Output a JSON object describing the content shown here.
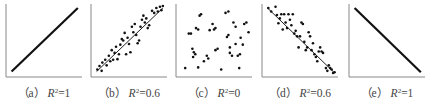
{
  "chart_data": [
    {
      "type": "scatter",
      "panel": "a",
      "label": "（a）",
      "r2_text": "R",
      "r2_sup": "2",
      "r2_value": "=1",
      "r2": 1,
      "trend": "positive",
      "xlim": [
        0,
        1
      ],
      "ylim": [
        0,
        1
      ],
      "line": [
        [
          0.05,
          0.05
        ],
        [
          0.97,
          0.97
        ]
      ],
      "points": []
    },
    {
      "type": "scatter",
      "panel": "b",
      "label": "（b）",
      "r2_text": "R",
      "r2_sup": "2",
      "r2_value": "=0.6",
      "r2": 0.6,
      "trend": "positive",
      "xlim": [
        0,
        1
      ],
      "ylim": [
        0,
        1
      ],
      "line": [
        [
          0.05,
          0.05
        ],
        [
          0.97,
          0.97
        ]
      ],
      "points": [
        [
          0.06,
          0.08
        ],
        [
          0.09,
          0.13
        ],
        [
          0.12,
          0.06
        ],
        [
          0.13,
          0.18
        ],
        [
          0.17,
          0.22
        ],
        [
          0.19,
          0.14
        ],
        [
          0.22,
          0.28
        ],
        [
          0.24,
          0.2
        ],
        [
          0.26,
          0.36
        ],
        [
          0.28,
          0.22
        ],
        [
          0.3,
          0.32
        ],
        [
          0.32,
          0.41
        ],
        [
          0.34,
          0.23
        ],
        [
          0.36,
          0.3
        ],
        [
          0.38,
          0.44
        ],
        [
          0.4,
          0.52
        ],
        [
          0.42,
          0.5
        ],
        [
          0.44,
          0.61
        ],
        [
          0.46,
          0.3
        ],
        [
          0.48,
          0.54
        ],
        [
          0.5,
          0.45
        ],
        [
          0.52,
          0.33
        ],
        [
          0.54,
          0.7
        ],
        [
          0.56,
          0.62
        ],
        [
          0.58,
          0.74
        ],
        [
          0.6,
          0.58
        ],
        [
          0.62,
          0.46
        ],
        [
          0.64,
          0.5
        ],
        [
          0.66,
          0.7
        ],
        [
          0.68,
          0.8
        ],
        [
          0.7,
          0.86
        ],
        [
          0.72,
          0.76
        ],
        [
          0.74,
          0.82
        ],
        [
          0.76,
          0.68
        ],
        [
          0.78,
          0.72
        ],
        [
          0.82,
          0.93
        ],
        [
          0.85,
          0.9
        ],
        [
          0.88,
          0.97
        ],
        [
          0.9,
          0.92
        ],
        [
          0.93,
          0.99
        ],
        [
          0.95,
          0.94
        ],
        [
          0.97,
          1.0
        ]
      ]
    },
    {
      "type": "scatter",
      "panel": "c",
      "label": "（c）",
      "r2_text": "R",
      "r2_sup": "2",
      "r2_value": "=0",
      "r2": 0,
      "trend": "none",
      "xlim": [
        0,
        1
      ],
      "ylim": [
        0,
        1
      ],
      "line": null,
      "points": [
        [
          0.1,
          0.1
        ],
        [
          0.15,
          0.6
        ],
        [
          0.18,
          0.6
        ],
        [
          0.2,
          0.38
        ],
        [
          0.21,
          0.26
        ],
        [
          0.22,
          0.33
        ],
        [
          0.24,
          0.3
        ],
        [
          0.25,
          0.68
        ],
        [
          0.28,
          0.66
        ],
        [
          0.28,
          0.11
        ],
        [
          0.3,
          0.86
        ],
        [
          0.32,
          0.88
        ],
        [
          0.36,
          0.2
        ],
        [
          0.4,
          0.28
        ],
        [
          0.42,
          0.24
        ],
        [
          0.44,
          0.65
        ],
        [
          0.48,
          0.74
        ],
        [
          0.5,
          0.66
        ],
        [
          0.52,
          0.36
        ],
        [
          0.52,
          0.68
        ],
        [
          0.55,
          0.38
        ],
        [
          0.6,
          0.08
        ],
        [
          0.66,
          0.9
        ],
        [
          0.7,
          0.92
        ],
        [
          0.68,
          0.55
        ],
        [
          0.7,
          0.58
        ],
        [
          0.72,
          0.4
        ],
        [
          0.72,
          0.32
        ],
        [
          0.75,
          0.28
        ],
        [
          0.77,
          0.76
        ],
        [
          0.8,
          0.7
        ],
        [
          0.8,
          0.45
        ],
        [
          0.83,
          0.28
        ],
        [
          0.85,
          0.1
        ],
        [
          0.87,
          0.54
        ],
        [
          0.9,
          0.44
        ],
        [
          0.92,
          0.74
        ],
        [
          0.95,
          0.76
        ],
        [
          0.98,
          0.62
        ],
        [
          0.86,
          0.3
        ]
      ]
    },
    {
      "type": "scatter",
      "panel": "d",
      "label": "（d）",
      "r2_text": "R",
      "r2_sup": "2",
      "r2_value": "=0.6",
      "r2": 0.6,
      "trend": "negative",
      "xlim": [
        0,
        1
      ],
      "ylim": [
        0,
        1
      ],
      "line": [
        [
          0.05,
          0.97
        ],
        [
          0.97,
          0.04
        ]
      ],
      "points": [
        [
          0.06,
          0.97
        ],
        [
          0.1,
          0.92
        ],
        [
          0.16,
          0.99
        ],
        [
          0.18,
          0.87
        ],
        [
          0.2,
          0.75
        ],
        [
          0.22,
          0.82
        ],
        [
          0.24,
          0.88
        ],
        [
          0.26,
          0.66
        ],
        [
          0.28,
          0.88
        ],
        [
          0.3,
          0.76
        ],
        [
          0.32,
          0.68
        ],
        [
          0.34,
          0.88
        ],
        [
          0.36,
          0.8
        ],
        [
          0.38,
          0.72
        ],
        [
          0.4,
          0.88
        ],
        [
          0.42,
          0.6
        ],
        [
          0.44,
          0.64
        ],
        [
          0.46,
          0.56
        ],
        [
          0.48,
          0.4
        ],
        [
          0.5,
          0.56
        ],
        [
          0.52,
          0.76
        ],
        [
          0.54,
          0.74
        ],
        [
          0.56,
          0.48
        ],
        [
          0.58,
          0.36
        ],
        [
          0.6,
          0.4
        ],
        [
          0.62,
          0.62
        ],
        [
          0.64,
          0.56
        ],
        [
          0.66,
          0.36
        ],
        [
          0.68,
          0.46
        ],
        [
          0.7,
          0.3
        ],
        [
          0.72,
          0.26
        ],
        [
          0.74,
          0.2
        ],
        [
          0.76,
          0.34
        ],
        [
          0.78,
          0.4
        ],
        [
          0.8,
          0.34
        ],
        [
          0.82,
          0.32
        ],
        [
          0.86,
          0.1
        ],
        [
          0.88,
          0.06
        ],
        [
          0.9,
          0.14
        ],
        [
          0.92,
          0.1
        ],
        [
          0.94,
          0.08
        ],
        [
          0.96,
          0.03
        ],
        [
          0.98,
          0.04
        ]
      ]
    },
    {
      "type": "scatter",
      "panel": "e",
      "label": "（e）",
      "r2_text": "R",
      "r2_sup": "2",
      "r2_value": "=1",
      "r2": 1,
      "trend": "negative",
      "xlim": [
        0,
        1
      ],
      "ylim": [
        0,
        1
      ],
      "line": [
        [
          0.05,
          0.97
        ],
        [
          0.97,
          0.04
        ]
      ],
      "points": []
    }
  ]
}
